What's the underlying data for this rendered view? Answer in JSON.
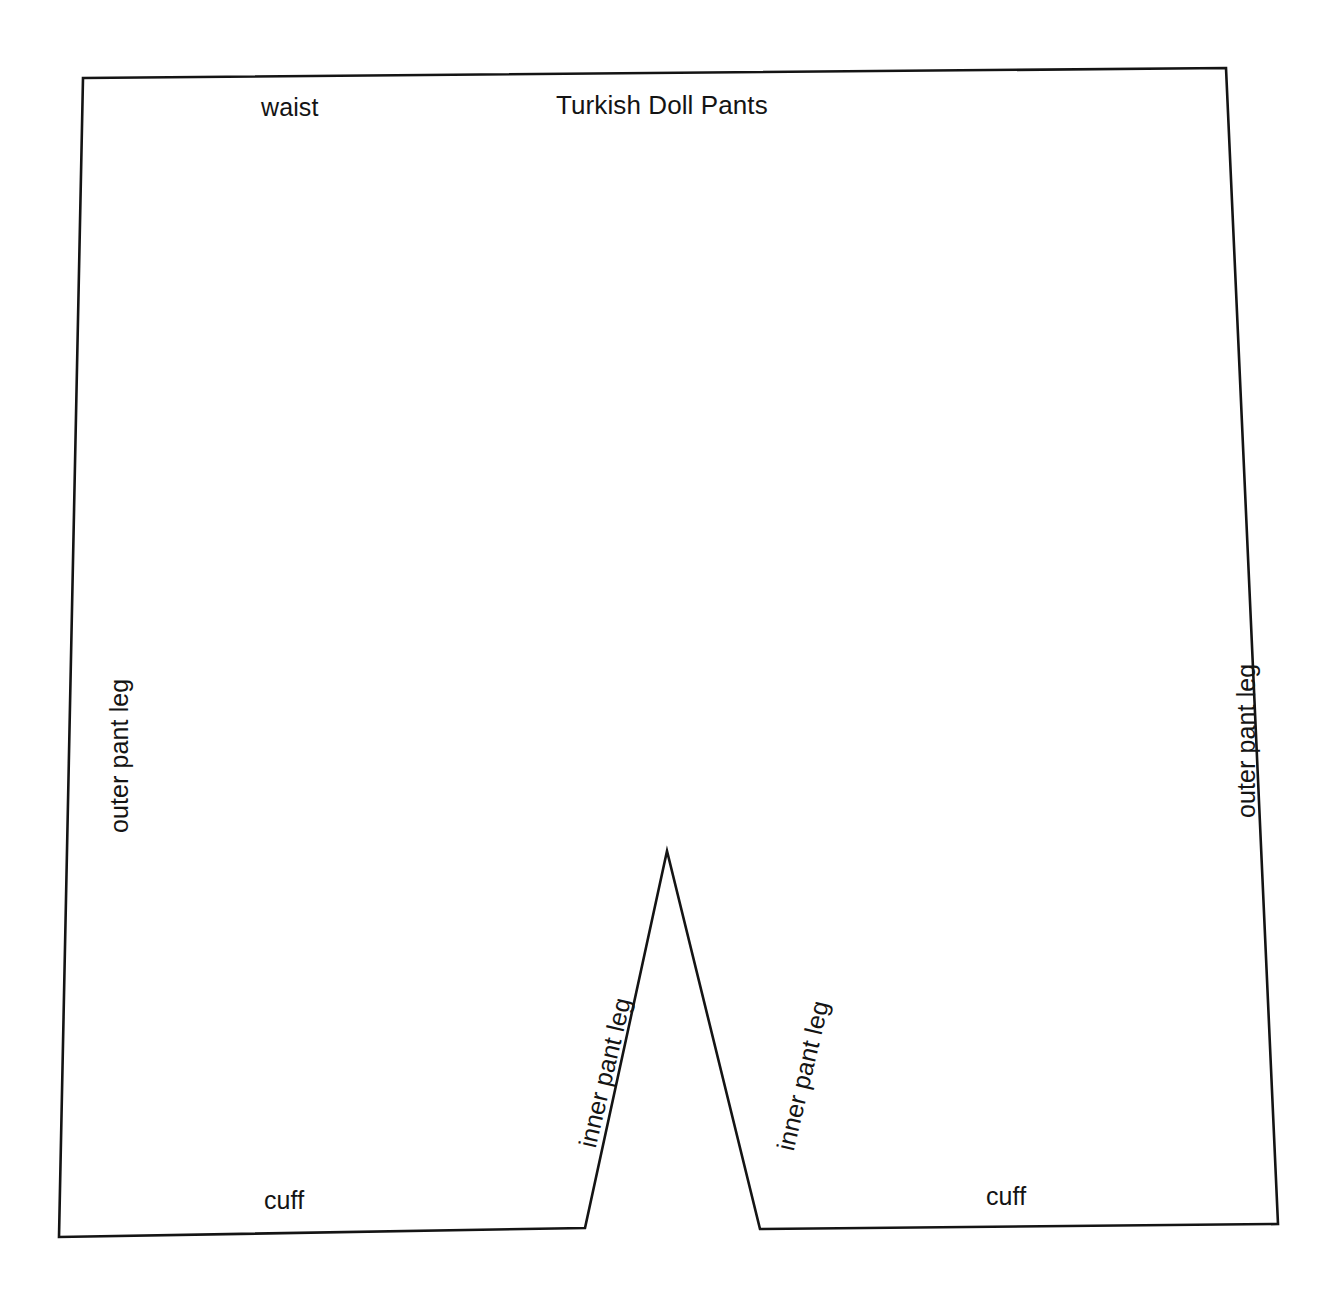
{
  "document": {
    "title": "Turkish Doll Pants",
    "background_color": "#ffffff",
    "line_color": "#141414",
    "line_width_px": 2.6,
    "width_px": 1333,
    "height_px": 1290
  },
  "diagram": {
    "type": "sewing-pattern-outline",
    "subject": "Turkish Doll Pants",
    "shape_points": [
      {
        "name": "top-left-waist",
        "x": 83,
        "y": 78
      },
      {
        "name": "top-right-waist",
        "x": 1226,
        "y": 68
      },
      {
        "name": "bottom-right-outer",
        "x": 1278,
        "y": 1224
      },
      {
        "name": "right-cuff-inner",
        "x": 760,
        "y": 1229
      },
      {
        "name": "crotch-peak",
        "x": 667,
        "y": 851
      },
      {
        "name": "left-cuff-inner",
        "x": 585,
        "y": 1228
      },
      {
        "name": "bottom-left-outer",
        "x": 59,
        "y": 1237
      }
    ],
    "edges": [
      {
        "name": "waist",
        "from": "top-left-waist",
        "to": "top-right-waist",
        "label": "waist"
      },
      {
        "name": "outer-pant-leg-right",
        "from": "top-right-waist",
        "to": "bottom-right-outer",
        "label": "outer pant leg"
      },
      {
        "name": "cuff-right",
        "from": "bottom-right-outer",
        "to": "right-cuff-inner",
        "label": "cuff"
      },
      {
        "name": "inner-pant-leg-right",
        "from": "right-cuff-inner",
        "to": "crotch-peak",
        "label": "inner pant leg"
      },
      {
        "name": "inner-pant-leg-left",
        "from": "crotch-peak",
        "to": "left-cuff-inner",
        "label": "inner pant leg"
      },
      {
        "name": "cuff-left",
        "from": "left-cuff-inner",
        "to": "bottom-left-outer",
        "label": "cuff"
      },
      {
        "name": "outer-pant-leg-left",
        "from": "bottom-left-outer",
        "to": "top-left-waist",
        "label": "outer pant leg"
      }
    ]
  },
  "labels": {
    "title": "Turkish Doll Pants",
    "waist": "waist",
    "outer_pant_leg_left": "outer pant leg",
    "outer_pant_leg_right": "outer pant leg",
    "inner_pant_leg_left": "inner pant leg",
    "inner_pant_leg_right": "inner pant leg",
    "cuff_left": "cuff",
    "cuff_right": "cuff"
  }
}
